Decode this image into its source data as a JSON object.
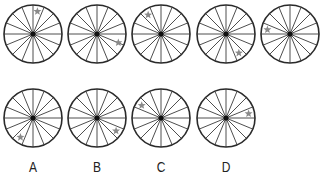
{
  "puzzle": {
    "type": "sequence-reasoning",
    "spokes": 16,
    "radius": 29,
    "colors": {
      "rim": "#2a2a2a",
      "spoke": "#3a3a3a",
      "hub": "#111111",
      "star": "#8a8a8a",
      "label": "#222222"
    },
    "sequence": [
      {
        "id": "seq-1",
        "cx": 33,
        "cy": 34,
        "star_angle_deg": 11
      },
      {
        "id": "seq-2",
        "cx": 97,
        "cy": 34,
        "star_angle_deg": 112
      },
      {
        "id": "seq-3",
        "cx": 161,
        "cy": 34,
        "star_angle_deg": 326
      },
      {
        "id": "seq-4",
        "cx": 226,
        "cy": 34,
        "star_angle_deg": 146
      },
      {
        "id": "seq-5",
        "cx": 290,
        "cy": 34,
        "star_angle_deg": 281
      }
    ],
    "options": [
      {
        "id": "option-a",
        "label": "A",
        "cx": 33,
        "cy": 118,
        "star_angle_deg": 213
      },
      {
        "id": "option-b",
        "label": "B",
        "cx": 97,
        "cy": 118,
        "star_angle_deg": 124
      },
      {
        "id": "option-c",
        "label": "C",
        "cx": 161,
        "cy": 118,
        "star_angle_deg": 303
      },
      {
        "id": "option-d",
        "label": "D",
        "cx": 226,
        "cy": 118,
        "star_angle_deg": 79
      }
    ],
    "label_y": 158
  }
}
